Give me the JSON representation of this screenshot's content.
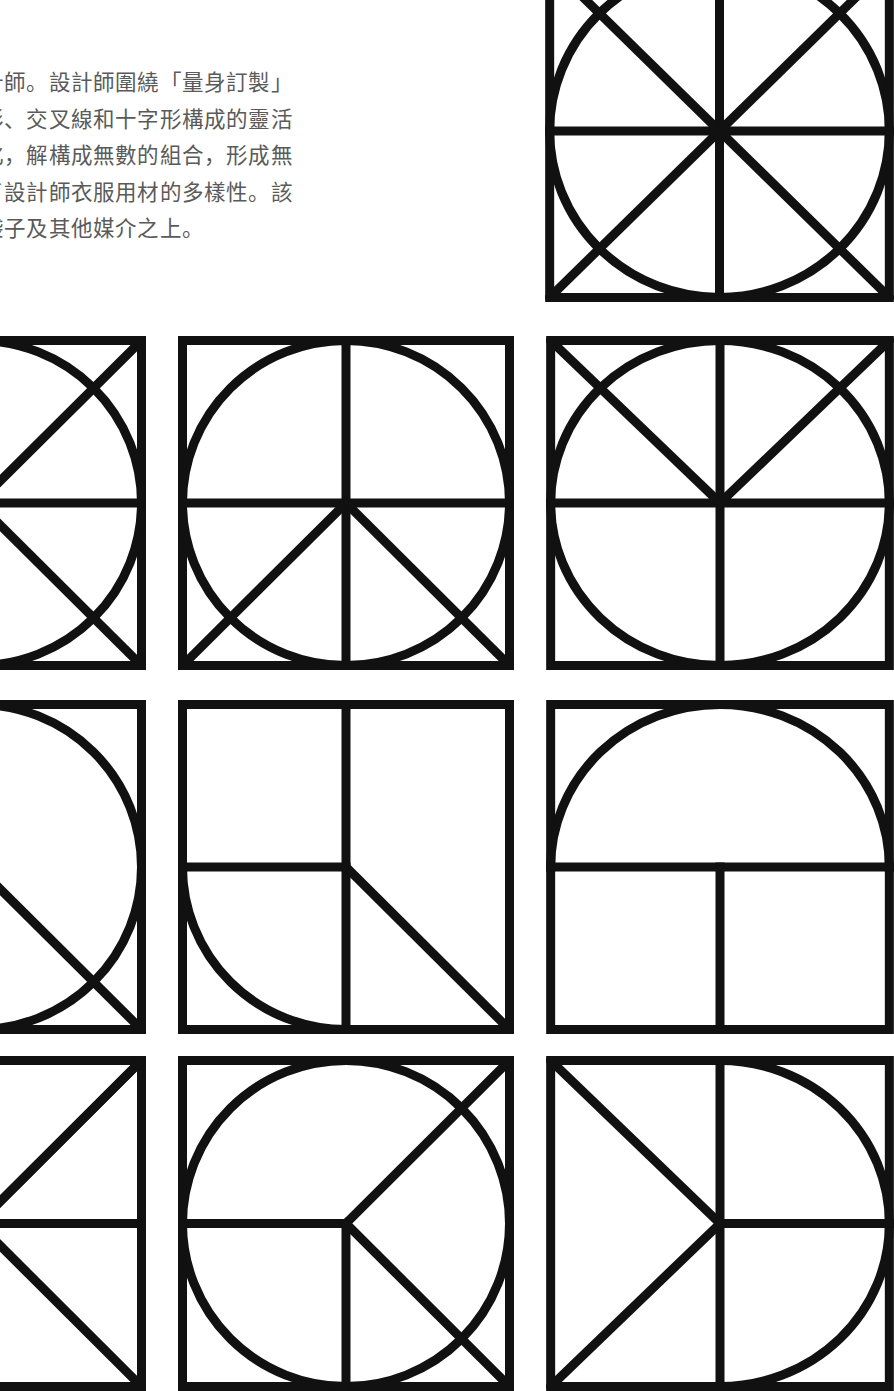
{
  "page": {
    "background_color": "#ffffff",
    "width": 894,
    "height": 1391
  },
  "article": {
    "text_color": "#5a5a5a",
    "body": "計師。設計師圍繞「量身訂製」\n形、交叉線和十字形構成的靈活\n化，解構成無數的組合，形成無\n了設計師衣服用材的多樣性。該\n袋子及其他媒介之上。"
  },
  "artwork": {
    "stroke_color": "#111111",
    "fill_color": "#ffffff",
    "description": "grid of square geometric tiles composed of circles, arcs, diagonals and cross lines",
    "tiles": [
      {
        "id": "tile-top-right",
        "name": "circle-with-full-cross-and-both-diagonals",
        "x": 545,
        "y": -40,
        "w": 349,
        "h": 342,
        "elements": [
          "square-border",
          "inscribed-circle",
          "vertical-center-line",
          "horizontal-center-line",
          "diagonal-tl-br",
          "diagonal-tr-bl"
        ]
      },
      {
        "id": "tile-r1c1",
        "name": "circle-with-cross-and-both-diagonals-clipped",
        "x": -190,
        "y": 336,
        "w": 336,
        "h": 334,
        "elements": [
          "square-border",
          "inscribed-circle",
          "horizontal-center-line",
          "diagonal-tl-br",
          "diagonal-tr-bl"
        ]
      },
      {
        "id": "tile-r1c2",
        "name": "circle-with-cross-and-lower-half-diagonals",
        "x": 178,
        "y": 336,
        "w": 336,
        "h": 334,
        "elements": [
          "square-border",
          "inscribed-circle",
          "vertical-center-line",
          "horizontal-center-line",
          "center-to-bottom-left",
          "center-to-bottom-right"
        ]
      },
      {
        "id": "tile-r1c3",
        "name": "circle-with-cross-and-upper-half-diagonals",
        "x": 546,
        "y": 336,
        "w": 348,
        "h": 334,
        "elements": [
          "square-border",
          "inscribed-circle",
          "vertical-center-line",
          "horizontal-center-line",
          "center-to-top-left",
          "center-to-top-right"
        ]
      },
      {
        "id": "tile-r2c1",
        "name": "circle-with-single-diagonal-clipped",
        "x": -190,
        "y": 700,
        "w": 336,
        "h": 334,
        "elements": [
          "square-border",
          "inscribed-circle",
          "diagonal-tl-br"
        ]
      },
      {
        "id": "tile-r2c2",
        "name": "quarter-arc-bottom-left-with-half-cross-and-diagonal",
        "x": 178,
        "y": 700,
        "w": 336,
        "h": 334,
        "elements": [
          "square-border",
          "vertical-full-line",
          "horizontal-left-half-line",
          "quarter-arc-bottom-left",
          "center-to-bottom-right"
        ]
      },
      {
        "id": "tile-r2c3",
        "name": "top-semicircle-with-horizontal-line-and-lower-vertical",
        "x": 546,
        "y": 700,
        "w": 348,
        "h": 334,
        "elements": [
          "square-border",
          "semicircle-top",
          "horizontal-center-line",
          "vertical-bottom-half-line"
        ]
      },
      {
        "id": "tile-r3c1",
        "name": "top-arc-with-upper-diagonals-and-horizontal-line-clipped",
        "x": -190,
        "y": 1056,
        "w": 336,
        "h": 335,
        "elements": [
          "square-border",
          "quarter-arc-top-right",
          "horizontal-center-line",
          "diagonal-tl-br-upper",
          "diagonal-tr-bl-upper"
        ]
      },
      {
        "id": "tile-r3c2",
        "name": "circle-with-left-horizontal-bottom-vertical-and-right-diagonals",
        "x": 178,
        "y": 1056,
        "w": 336,
        "h": 335,
        "elements": [
          "square-border",
          "inscribed-circle",
          "horizontal-left-half-line",
          "vertical-bottom-half-line",
          "center-to-top-right",
          "center-to-bottom-right"
        ]
      },
      {
        "id": "tile-r3c3",
        "name": "right-semicircle-with-vertical-line-and-left-diagonals",
        "x": 546,
        "y": 1056,
        "w": 348,
        "h": 335,
        "elements": [
          "square-border",
          "semicircle-right",
          "vertical-full-line",
          "horizontal-right-half-line",
          "center-to-top-left",
          "center-to-bottom-left"
        ]
      }
    ]
  }
}
